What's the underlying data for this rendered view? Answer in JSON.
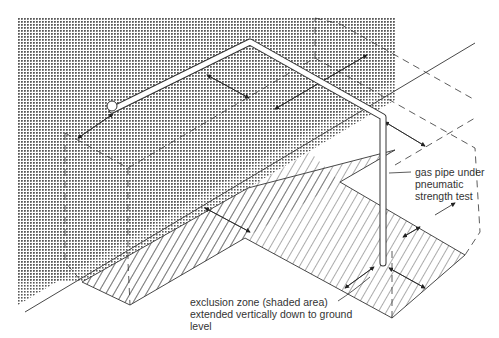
{
  "labels": {
    "pipe": "gas pipe under\npneumatic\nstrength test",
    "zone": "exclusion zone (shaded area)\nextended vertically down to ground\nlevel"
  },
  "colors": {
    "line": "#333333",
    "stipple": "#555555",
    "background": "#ffffff",
    "pipe_fill": "#ffffff"
  }
}
